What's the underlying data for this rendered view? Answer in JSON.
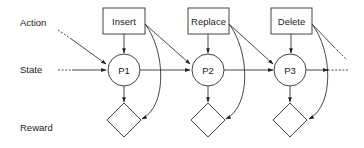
{
  "diagram": {
    "type": "influence-diagram",
    "row_labels": {
      "action": "Action",
      "state": "State",
      "reward": "Reward"
    },
    "actions": [
      {
        "label": "Insert"
      },
      {
        "label": "Replace"
      },
      {
        "label": "Delete"
      }
    ],
    "states": [
      {
        "label": "P1"
      },
      {
        "label": "P2"
      },
      {
        "label": "P3"
      }
    ],
    "rewards": [
      {
        "label": ""
      },
      {
        "label": ""
      },
      {
        "label": ""
      }
    ],
    "colors": {
      "stroke": "#444444",
      "text": "#222222",
      "background": "#ffffff"
    }
  }
}
